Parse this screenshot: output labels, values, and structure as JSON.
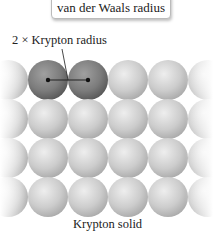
{
  "callout": {
    "text": "van der Waals radius"
  },
  "annotation": {
    "text": "2 × Krypton radius"
  },
  "caption": {
    "text": "Krypton solid"
  },
  "lattice": {
    "rows": 4,
    "columns_visible": 4,
    "partial_columns": [
      "left edge",
      "right edge"
    ],
    "highlighted_atoms": [
      [
        0,
        0
      ],
      [
        0,
        1
      ]
    ],
    "colors": {
      "atom": "#c8c8c8",
      "highlighted_atom": "#808080",
      "line": "#222222"
    }
  }
}
